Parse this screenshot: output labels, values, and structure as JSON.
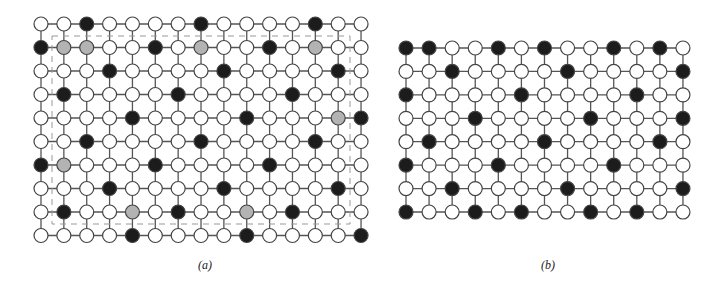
{
  "figure": {
    "colors": {
      "edge": "#555555",
      "node_stroke": "#444444",
      "white": "#ffffff",
      "black": "#1c1c1c",
      "gray": "#b3b3b3",
      "dash": "#999999"
    },
    "panels": [
      {
        "id": "a",
        "caption": "(a)",
        "caption_pos": [
          205,
          268
        ],
        "origin": [
          41,
          24
        ],
        "dx": 22.86,
        "dy": 23.5,
        "cols": 15,
        "rows": 10,
        "black": [
          [
            2,
            7,
            12
          ],
          [
            0,
            5,
            10
          ],
          [
            3,
            8,
            13
          ],
          [
            1,
            6,
            11
          ],
          [
            4,
            9,
            14
          ],
          [
            2,
            7,
            12
          ],
          [
            0,
            5,
            10
          ],
          [
            3,
            8,
            13
          ],
          [
            1,
            6,
            11
          ],
          [
            4,
            9,
            14
          ]
        ],
        "gray": [
          [],
          [
            1,
            2,
            7,
            12
          ],
          [],
          [],
          [
            13
          ],
          [],
          [
            1
          ],
          [],
          [
            4,
            9
          ],
          []
        ],
        "dashed_rect": [
          52,
          36,
          350,
          224
        ]
      },
      {
        "id": "b",
        "caption": "(b)",
        "caption_pos": [
          548,
          268
        ],
        "origin": [
          406,
          48
        ],
        "dx": 23.08,
        "dy": 23.43,
        "cols": 13,
        "rows": 8,
        "black": [
          [
            0,
            1,
            4,
            6,
            9,
            11
          ],
          [
            2,
            7,
            12
          ],
          [
            0,
            5,
            10
          ],
          [
            3,
            8,
            12
          ],
          [
            1,
            6,
            11
          ],
          [
            0,
            4,
            9
          ],
          [
            2,
            7,
            12
          ],
          [
            0,
            3,
            5,
            8,
            10
          ]
        ],
        "gray": [
          [],
          [],
          [],
          [],
          [],
          [],
          [],
          []
        ],
        "dashed_rect": null
      }
    ],
    "node_radius": 7
  }
}
